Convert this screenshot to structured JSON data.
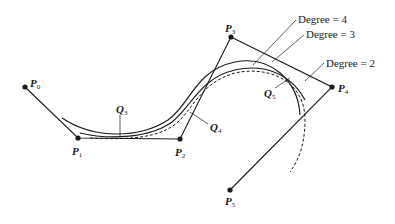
{
  "diagram": {
    "control_points": [
      {
        "name": "P",
        "sub": "0"
      },
      {
        "name": "P",
        "sub": "1"
      },
      {
        "name": "P",
        "sub": "2"
      },
      {
        "name": "P",
        "sub": "3"
      },
      {
        "name": "P",
        "sub": "4"
      },
      {
        "name": "P",
        "sub": "5"
      }
    ],
    "q_points": [
      {
        "name": "Q",
        "sub": "3"
      },
      {
        "name": "Q",
        "sub": "4"
      },
      {
        "name": "Q",
        "sub": "5"
      }
    ],
    "curves": [
      {
        "label": "Degree = 4",
        "style": "solid"
      },
      {
        "label": "Degree = 3",
        "style": "solid"
      },
      {
        "label": "Degree = 2",
        "style": "dashed"
      }
    ],
    "colors": {
      "ink": "#1a1a1a",
      "background": "#ffffff"
    }
  }
}
